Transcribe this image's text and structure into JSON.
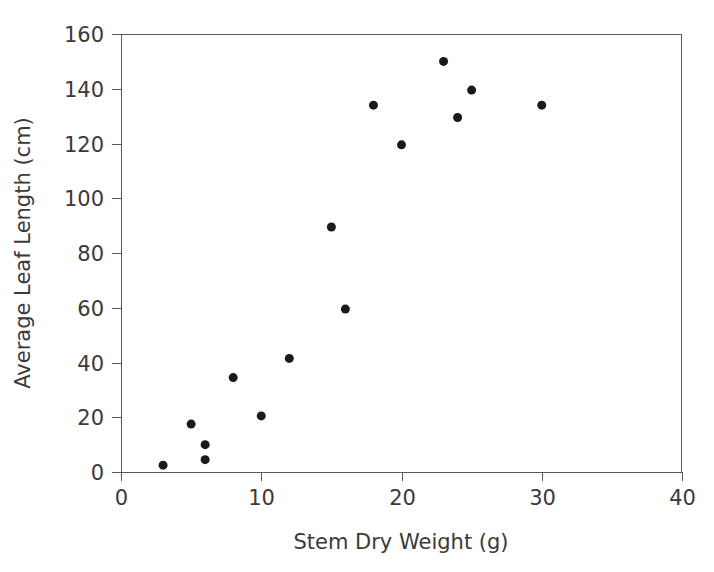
{
  "chart_data": {
    "type": "scatter",
    "title": "",
    "subtitle": "",
    "xlabel": "Stem Dry Weight (g)",
    "ylabel": "Average Leaf Length (cm)",
    "xlim": [
      0,
      40
    ],
    "ylim": [
      0,
      160
    ],
    "xticks": [
      0,
      10,
      20,
      30,
      40
    ],
    "yticks": [
      0,
      20,
      40,
      60,
      80,
      100,
      120,
      140,
      160
    ],
    "xtick_labels": [
      "0",
      "10",
      "20",
      "30",
      "40"
    ],
    "ytick_labels": [
      "0",
      "20",
      "40",
      "60",
      "80",
      "100",
      "120",
      "140",
      "160"
    ],
    "grid": false,
    "legend": null,
    "marker": {
      "shape": "circle",
      "color": "#1a1a1a",
      "size_px": 9
    },
    "series": [
      {
        "name": "observations",
        "x": [
          3,
          5,
          6,
          6,
          8,
          10,
          12,
          15,
          16,
          18,
          20,
          23,
          24,
          25,
          30
        ],
        "y": [
          2.5,
          17.5,
          10,
          4.5,
          34.5,
          20.5,
          41.5,
          89.5,
          59.5,
          134,
          119.5,
          150,
          129.5,
          139.5,
          134
        ]
      }
    ],
    "points": [
      {
        "x": 3,
        "y": 2.5
      },
      {
        "x": 5,
        "y": 17.5
      },
      {
        "x": 6,
        "y": 10
      },
      {
        "x": 6,
        "y": 4.5
      },
      {
        "x": 8,
        "y": 34.5
      },
      {
        "x": 10,
        "y": 20.5
      },
      {
        "x": 12,
        "y": 41.5
      },
      {
        "x": 15,
        "y": 89.5
      },
      {
        "x": 16,
        "y": 59.5
      },
      {
        "x": 18,
        "y": 134
      },
      {
        "x": 20,
        "y": 119.5
      },
      {
        "x": 23,
        "y": 150
      },
      {
        "x": 24,
        "y": 129.5
      },
      {
        "x": 25,
        "y": 139.5
      },
      {
        "x": 30,
        "y": 134
      }
    ],
    "axis_color": "#58585a",
    "text_color": "#3a3a3a",
    "background": "#ffffff"
  },
  "plot_geometry": {
    "left": 121,
    "right": 682,
    "top": 34,
    "bottom": 472
  }
}
